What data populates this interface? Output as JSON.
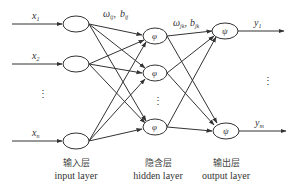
{
  "diagram": {
    "type": "neural-network",
    "inputs": [
      {
        "label": "x",
        "sub": "1"
      },
      {
        "label": "x",
        "sub": "2"
      },
      {
        "label": "x",
        "sub": "n"
      }
    ],
    "input_ellipsis": "⋮",
    "hidden_nodes": [
      {
        "symbol": "φ"
      },
      {
        "symbol": "φ"
      },
      {
        "symbol": "φ"
      }
    ],
    "hidden_ellipsis": "⋮",
    "output_nodes": [
      {
        "symbol": "ψ"
      },
      {
        "symbol": "ψ"
      }
    ],
    "outputs": [
      {
        "label": "y",
        "sub": "1"
      },
      {
        "label": "y",
        "sub": "m"
      }
    ],
    "output_ellipsis": "⋮",
    "weights_input_hidden": {
      "w": "ω",
      "w_sub": "ij",
      "sep": ",",
      "b": "b",
      "b_sub": "ij"
    },
    "weights_hidden_output": {
      "w": "ω",
      "w_sub": "jk",
      "sep": ",",
      "b": "b",
      "b_sub": "jk"
    },
    "layers": [
      {
        "cn": "输入层",
        "en": "input layer"
      },
      {
        "cn": "隐含层",
        "en": "hidden layer"
      },
      {
        "cn": "输出层",
        "en": "output layer"
      }
    ]
  }
}
